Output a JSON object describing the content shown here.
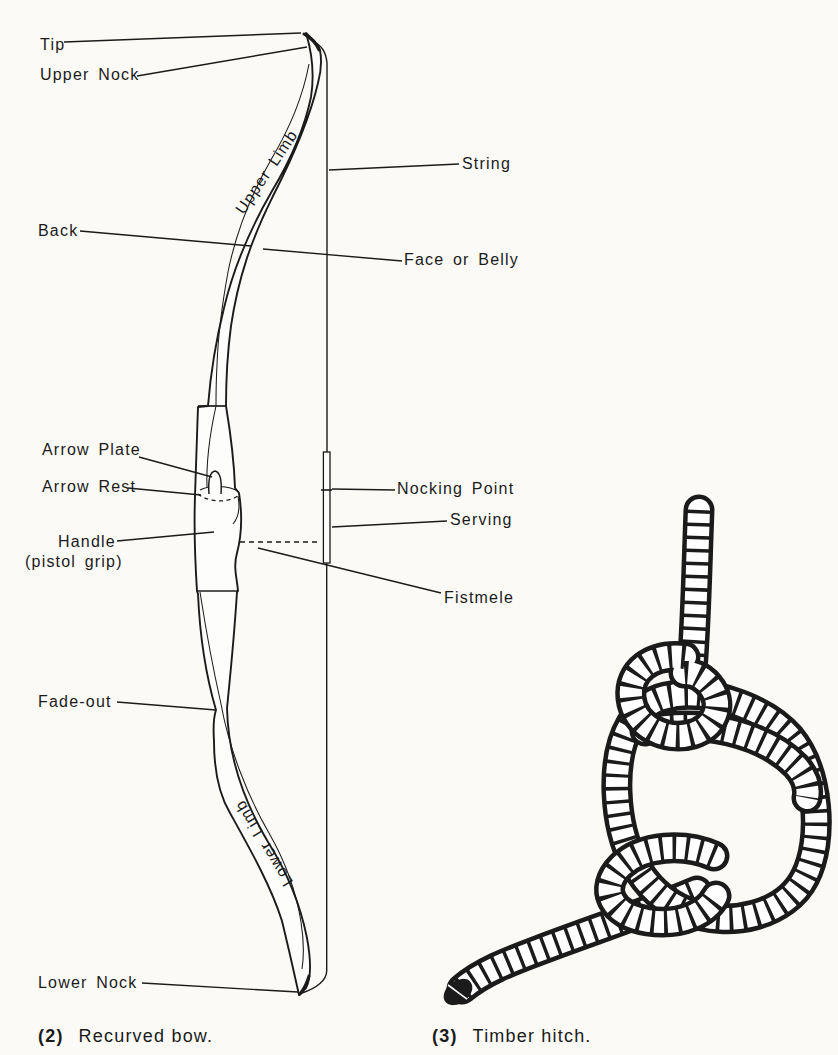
{
  "figure": {
    "ink_color": "#1b1b1b",
    "paper_color": "#fbfaf7"
  },
  "bow_diagram": {
    "labels": {
      "tip": "Tip",
      "upper_nock": "Upper Nock",
      "upper_limb": "Upper Limb",
      "back": "Back",
      "string": "String",
      "face_or_belly": "Face or Belly",
      "arrow_plate": "Arrow Plate",
      "arrow_rest": "Arrow Rest",
      "handle": "Handle",
      "handle_sub": "(pistol grip)",
      "nocking_point": "Nocking Point",
      "serving": "Serving",
      "fistmele": "Fistmele",
      "fade_out": "Fade-out",
      "lower_limb": "Lower Limb",
      "lower_nock": "Lower Nock"
    },
    "caption": {
      "number": "(2)",
      "text": "Recurved bow."
    }
  },
  "knot_diagram": {
    "caption": {
      "number": "(3)",
      "text": "Timber hitch."
    }
  }
}
